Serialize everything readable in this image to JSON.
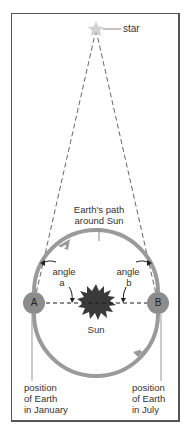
{
  "diagram": {
    "title_labels": {
      "star": "star",
      "path_line1": "Earth's path",
      "path_line2": "around Sun",
      "angle_a_line1": "angle",
      "angle_a_line2": "a",
      "angle_b_line1": "angle",
      "angle_b_line2": "b",
      "earth_a": "A",
      "earth_b": "B",
      "sun": "Sun",
      "january_line1": "position",
      "january_line2": "of Earth",
      "january_line3": "in January",
      "july_line1": "position",
      "july_line2": "of Earth",
      "july_line3": "in July"
    },
    "colors": {
      "orbit": "#9a9a9a",
      "earth": "#8c8c8c",
      "sun": "#3a3a3a",
      "star": "#cfcfcf",
      "border": "#555555",
      "text": "#333333"
    }
  }
}
